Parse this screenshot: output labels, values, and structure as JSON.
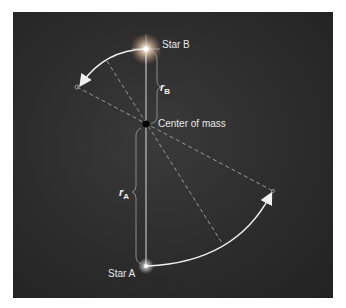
{
  "labels": {
    "star_b": "Star B",
    "star_a": "Star A",
    "center_of_mass": "Center of mass",
    "r_b_main": "r",
    "r_b_sub": "B",
    "r_a_main": "r",
    "r_a_sub": "A"
  },
  "colors": {
    "background": "#2c2c2c",
    "line": "#d8d8d8",
    "dashed": "#9a9a9a",
    "text": "#e8e8e8"
  }
}
